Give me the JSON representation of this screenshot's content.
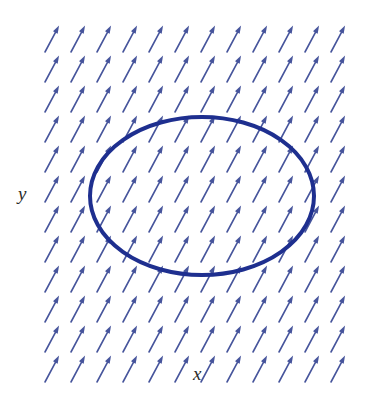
{
  "figure": {
    "background_color": "#ffffff",
    "width": 387,
    "height": 393
  },
  "axes": {
    "x_label": "x",
    "y_label": "y",
    "x_label_position": {
      "x": 200,
      "y": 373
    },
    "y_label_position": {
      "x": 25,
      "y": 193
    }
  },
  "chart_data": {
    "type": "scatter",
    "subtype": "quiver-vector-field",
    "title": "",
    "xlabel": "x",
    "ylabel": "y",
    "grid": false,
    "legend": null,
    "annotations": [],
    "vector_field": {
      "arrow_color": "#47559c",
      "arrow_direction_degrees": 62,
      "arrow_length_px": 30,
      "arrow_head_length_px": 8,
      "arrow_line_width_px": 1.6,
      "columns": 12,
      "rows": 12,
      "origin": {
        "x": 45,
        "y": 52
      },
      "spacing": {
        "x": 26,
        "y": 30
      },
      "description": "Uniform field, all arrows point up and to the right at the same angle and magnitude"
    },
    "curve": {
      "name": "closed-ellipse-path",
      "shape": "ellipse",
      "stroke_color": "#1e2f8f",
      "stroke_width_px": 4,
      "fill": "none",
      "center": {
        "x": 202,
        "y": 196
      },
      "radius_x": 112,
      "radius_y": 79
    },
    "xlim": [
      0,
      387
    ],
    "ylim": [
      0,
      393
    ]
  }
}
